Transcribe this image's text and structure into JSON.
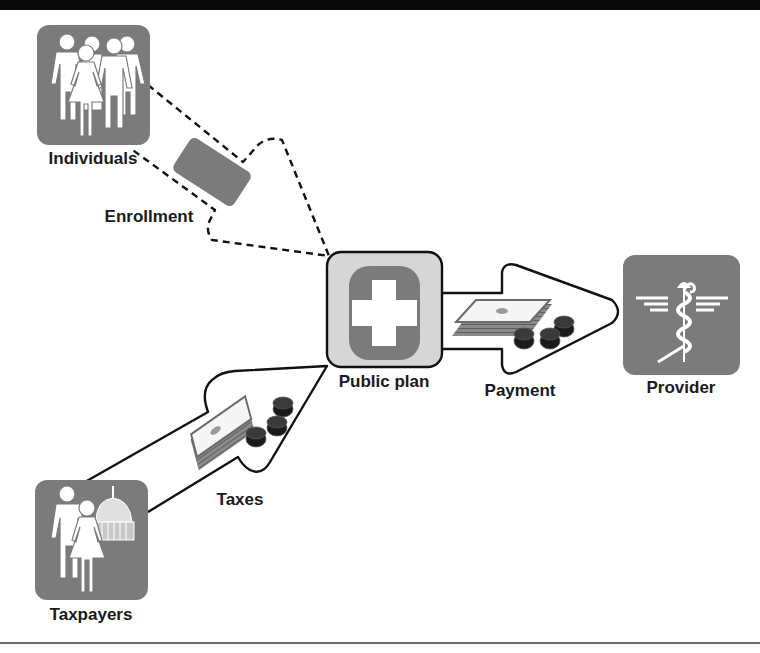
{
  "diagram": {
    "nodes": [
      {
        "id": "individuals",
        "label": "Individuals",
        "icon": "group-of-people-icon"
      },
      {
        "id": "public_plan",
        "label": "Public plan",
        "icon": "medical-cross-icon"
      },
      {
        "id": "provider",
        "label": "Provider",
        "icon": "caduceus-icon"
      },
      {
        "id": "taxpayers",
        "label": "Taxpayers",
        "icon": "people-and-capitol-icon"
      }
    ],
    "edges": [
      {
        "from": "individuals",
        "to": "public_plan",
        "label": "Enrollment",
        "style": "dashed",
        "icon": "enrollment-card-icon"
      },
      {
        "from": "taxpayers",
        "to": "public_plan",
        "label": "Taxes",
        "style": "solid",
        "icon": "money-and-coins-icon"
      },
      {
        "from": "public_plan",
        "to": "provider",
        "label": "Payment",
        "style": "solid",
        "icon": "money-and-coins-icon"
      }
    ],
    "colors": {
      "icon_bg": "#7b7b7b",
      "plan_bg": "#d6d6d6",
      "stroke": "#111111",
      "topbar": "#0a0a0a"
    }
  },
  "labels": {
    "individuals": "Individuals",
    "enrollment": "Enrollment",
    "public_plan": "Public plan",
    "payment": "Payment",
    "provider": "Provider",
    "taxes": "Taxes",
    "taxpayers": "Taxpayers"
  }
}
